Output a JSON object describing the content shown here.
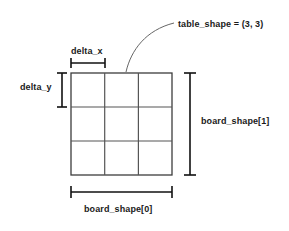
{
  "diagram": {
    "type": "annotated-grid",
    "colors": {
      "background": "#ffffff",
      "grid_outer_stroke": "#3c3c3c",
      "grid_inner_stroke": "#555555",
      "bracket_stroke": "#111111",
      "leader_stroke": "#666666",
      "text": "#1a1a1a"
    },
    "grid": {
      "rows": 3,
      "cols": 3,
      "x": 71,
      "y": 73,
      "width": 101,
      "height": 102,
      "cell_width": 33.7,
      "cell_height": 34
    },
    "labels": {
      "table_shape": "table_shape = (3, 3)",
      "delta_x": "delta_x",
      "delta_y": "delta_y",
      "board_shape_1": "board_shape[1]",
      "board_shape_0": "board_shape[0]"
    },
    "annotations": {
      "table_shape_value": "(3, 3)",
      "delta_x_span": "one cell width",
      "delta_y_span": "one cell height",
      "board_shape_0_span": "full grid width",
      "board_shape_1_span": "full grid height"
    }
  }
}
